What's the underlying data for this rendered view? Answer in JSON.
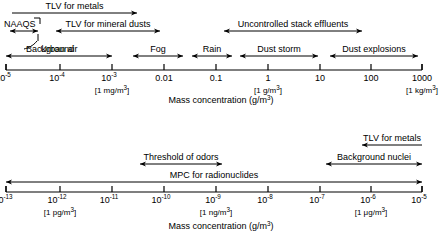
{
  "figure": {
    "type": "log-scale-range-diagram",
    "panels": [
      {
        "id": "top",
        "axis_caption": "Mass concentration (g/m",
        "axis_caption_sup": "3",
        "axis_caption_tail": ")",
        "ticks": [
          {
            "label": "10",
            "sup": "-5",
            "x": 6
          },
          {
            "label": "10",
            "sup": "-4",
            "x": 60
          },
          {
            "label": "10",
            "sup": "-3",
            "x": 112
          },
          {
            "label": "0.01",
            "sup": "",
            "x": 164
          },
          {
            "label": "0.1",
            "sup": "",
            "x": 216
          },
          {
            "label": "1",
            "sup": "",
            "x": 268
          },
          {
            "label": "10",
            "sup": "",
            "x": 320
          },
          {
            "label": "100",
            "sup": "",
            "x": 371
          },
          {
            "label": "1000",
            "sup": "",
            "x": 422
          }
        ],
        "unit_notes": [
          {
            "text": "[1 mg/m",
            "sup": "3",
            "tail": "]",
            "x": 112
          },
          {
            "text": "[1 g/m",
            "sup": "3",
            "tail": "]",
            "x": 268
          },
          {
            "text": "[1 kg/m",
            "sup": "3",
            "tail": "]",
            "x": 422
          }
        ],
        "ranges": [
          {
            "name": "TLV for metals",
            "label": "TLV for metals",
            "x1": 12,
            "x2": 137,
            "row": 0,
            "head_left": false,
            "head_right": true
          },
          {
            "name": "NAAQS",
            "label": "NAAQS",
            "x1": 10,
            "x2": 38,
            "row": 1,
            "head_left": true,
            "head_right": true,
            "label_anchor": "left",
            "label_x": 4
          },
          {
            "name": "TLV for mineral dusts",
            "label": "TLV for mineral dusts",
            "x1": 56,
            "x2": 160,
            "row": 1,
            "head_left": true,
            "head_right": true
          },
          {
            "name": "Uncontrolled stack effluents",
            "label": "Uncontrolled stack effluents",
            "x1": 224,
            "x2": 362,
            "row": 1,
            "head_left": true,
            "head_right": true
          },
          {
            "name": "Background",
            "label": "Background",
            "x1": 34,
            "x2": 40,
            "row": 2,
            "head_left": false,
            "head_right": false,
            "leader": true
          },
          {
            "name": "Urban air",
            "label": "Urban air",
            "x1": 6,
            "x2": 112,
            "row": 3,
            "head_left": true,
            "head_right": true
          },
          {
            "name": "Fog",
            "label": "Fog",
            "x1": 133,
            "x2": 183,
            "row": 3,
            "head_left": true,
            "head_right": true
          },
          {
            "name": "Rain",
            "label": "Rain",
            "x1": 192,
            "x2": 232,
            "row": 3,
            "head_left": true,
            "head_right": true
          },
          {
            "name": "Dust storm",
            "label": "Dust storm",
            "x1": 240,
            "x2": 318,
            "row": 3,
            "head_left": true,
            "head_right": true
          },
          {
            "name": "Dust explosions",
            "label": "Dust explosions",
            "x1": 330,
            "x2": 418,
            "row": 3,
            "head_left": true,
            "head_right": true
          }
        ]
      },
      {
        "id": "bottom",
        "axis_caption": "Mass concentration (g/m",
        "axis_caption_sup": "3",
        "axis_caption_tail": ")",
        "ticks": [
          {
            "label": "10",
            "sup": "-13",
            "x": 6
          },
          {
            "label": "10",
            "sup": "-12",
            "x": 60
          },
          {
            "label": "10",
            "sup": "-11",
            "x": 112
          },
          {
            "label": "10",
            "sup": "-10",
            "x": 164
          },
          {
            "label": "10",
            "sup": "-9",
            "x": 216
          },
          {
            "label": "10",
            "sup": "-8",
            "x": 268
          },
          {
            "label": "10",
            "sup": "-7",
            "x": 320
          },
          {
            "label": "10",
            "sup": "-6",
            "x": 371
          },
          {
            "label": "10",
            "sup": "-5",
            "x": 422
          }
        ],
        "unit_notes": [
          {
            "text": "[1 pg/m",
            "sup": "3",
            "tail": "]",
            "x": 60
          },
          {
            "text": "[1 ng/m",
            "sup": "3",
            "tail": "]",
            "x": 216
          },
          {
            "text": "[1 μg/m",
            "sup": "3",
            "tail": "]",
            "x": 371
          }
        ],
        "ranges": [
          {
            "name": "TLV for metals",
            "label": "TLV for metals",
            "x1": 362,
            "x2": 422,
            "row": 0,
            "head_left": true,
            "head_right": false
          },
          {
            "name": "Threshold of odors",
            "label": "Threshold of odors",
            "x1": 140,
            "x2": 222,
            "row": 1,
            "head_left": true,
            "head_right": true
          },
          {
            "name": "Background nuclei",
            "label": "Background nuclei",
            "x1": 326,
            "x2": 422,
            "row": 1,
            "head_left": true,
            "head_right": true
          },
          {
            "name": "MPC for radionuclides",
            "label": "MPC for radionuclides",
            "x1": 6,
            "x2": 422,
            "row": 2,
            "head_left": true,
            "head_right": true
          }
        ]
      }
    ]
  }
}
